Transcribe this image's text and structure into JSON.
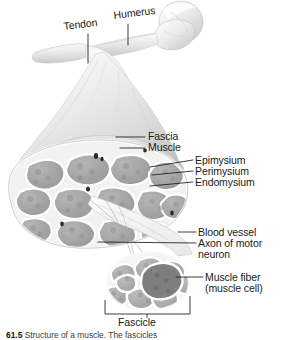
{
  "figure": {
    "style": "grayscale anatomical illustration"
  },
  "labels": {
    "tendon": "Tendon",
    "humerus": "Humerus",
    "fascia": "Fascia",
    "muscle": "Muscle",
    "epimysium": "Epimysium",
    "perimysium": "Perimysium",
    "endomysium": "Endomysium",
    "blood_vessel": "Blood vessel",
    "axon": "Axon of motor neuron",
    "muscle_fiber": "Muscle fiber (muscle cell)",
    "fascicle": "Fascicle"
  },
  "caption": {
    "number": "61.5",
    "text": "Structure of a muscle. The fascicles"
  },
  "colors": {
    "text": "#1b1b1b",
    "leader_line": "#1b1b1b",
    "bone_light": "#f2f2f2",
    "bone_shade": "#cfcfcf",
    "muscle_light": "#ededed",
    "muscle_mid": "#c9c9c9",
    "fascicle_fill": "#a8a8a8",
    "fascicle_dark": "#8d8d8d",
    "connective_tissue": "#f4f4f4",
    "background": "#ffffff"
  }
}
